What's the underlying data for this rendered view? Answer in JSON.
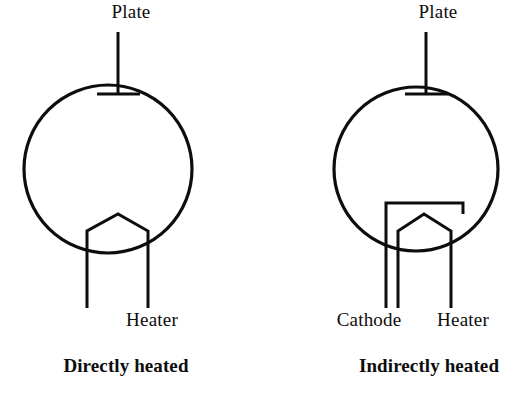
{
  "figure": {
    "background_color": "#ffffff",
    "stroke_color": "#0d0d0d"
  },
  "diagrams": [
    {
      "id": "directly-heated",
      "caption": "Directly heated",
      "labels": {
        "plate": "Plate",
        "heater": "Heater"
      },
      "geometry": {
        "envelope": {
          "cx": 108,
          "cy": 169,
          "r": 84
        },
        "plate_lead": {
          "x": 118,
          "y_top": 32,
          "y_bottom": 94
        },
        "plate_bar": {
          "y": 94,
          "x_left": 97,
          "x_right": 140
        },
        "filament": {
          "apex": [
            118,
            214
          ],
          "left_shoulder": [
            87,
            231
          ],
          "right_shoulder": [
            148,
            231
          ],
          "leg_bottom_y": 308
        }
      },
      "label_positions": {
        "plate": [
          131,
          18
        ],
        "heater": [
          152,
          326
        ],
        "caption": [
          126,
          372
        ]
      }
    },
    {
      "id": "indirectly-heated",
      "caption": "Indirectly heated",
      "labels": {
        "plate": "Plate",
        "cathode": "Cathode",
        "heater": "Heater"
      },
      "geometry": {
        "envelope": {
          "cx": 416,
          "cy": 169,
          "r": 82
        },
        "plate_lead": {
          "x": 426,
          "y_top": 32,
          "y_bottom": 94
        },
        "plate_bar": {
          "y": 94,
          "x_left": 405,
          "x_right": 448
        },
        "cathode": {
          "top_y": 203,
          "x_left": 386,
          "x_right": 463,
          "right_stub_bottom_y": 214,
          "left_leg_bottom_y": 308
        },
        "filament": {
          "apex": [
            424,
            214
          ],
          "left_shoulder": [
            398,
            231
          ],
          "right_shoulder": [
            451,
            231
          ],
          "leg_bottom_y": 308
        }
      },
      "label_positions": {
        "plate": [
          438,
          18
        ],
        "cathode": [
          369,
          326
        ],
        "heater": [
          463,
          326
        ],
        "caption": [
          429,
          372
        ]
      }
    }
  ]
}
